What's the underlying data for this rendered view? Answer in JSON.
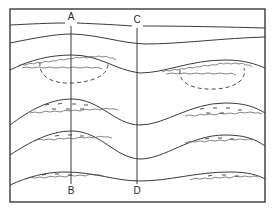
{
  "diagram": {
    "type": "geological-cross-section",
    "section_lines": [
      {
        "top_label": "A",
        "bottom_label": "B"
      },
      {
        "top_label": "C",
        "bottom_label": "D"
      }
    ],
    "colors": {
      "line": "#3a3a3a",
      "background": "#ffffff"
    }
  }
}
